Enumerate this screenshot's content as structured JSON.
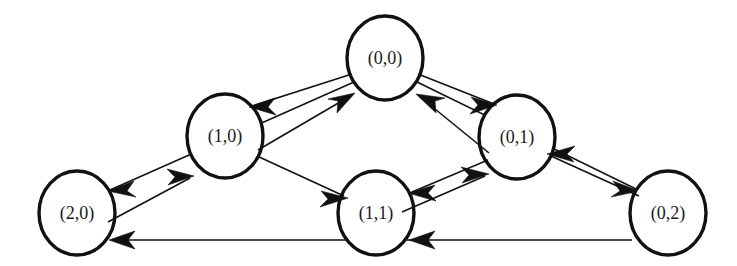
{
  "diagram": {
    "background_color": "#ffffff",
    "stroke_color": "#111111",
    "node_fill": "#ffffff",
    "width": 737,
    "height": 266,
    "node_radius": 41,
    "nodes": [
      {
        "id": "n00",
        "label": "(0,0)",
        "cx": 385,
        "cy": 58,
        "rx": 41,
        "ry": 44
      },
      {
        "id": "n10",
        "label": "(1,0)",
        "cx": 225,
        "cy": 136,
        "rx": 41,
        "ry": 44
      },
      {
        "id": "n01",
        "label": "(0,1)",
        "cx": 517,
        "cy": 137,
        "rx": 41,
        "ry": 44
      },
      {
        "id": "n20",
        "label": "(2,0)",
        "cx": 77,
        "cy": 213,
        "rx": 41,
        "ry": 44
      },
      {
        "id": "n11",
        "label": "(1,1)",
        "cx": 376,
        "cy": 213,
        "rx": 41,
        "ry": 44
      },
      {
        "id": "n02",
        "label": "(0,2)",
        "cx": 668,
        "cy": 213,
        "rx": 41,
        "ry": 44
      }
    ],
    "edges": [
      {
        "id": "e1",
        "from": "(0,0)",
        "to": "(1,0)",
        "name": "edge-00-to-10"
      },
      {
        "id": "e2",
        "from": "(0,0)",
        "to": "(2,0)",
        "name": "edge-00-to-20"
      },
      {
        "id": "e3",
        "from": "(0,0)",
        "to": "(0,1)",
        "name": "edge-00-to-01"
      },
      {
        "id": "e4",
        "from": "(0,0)",
        "to": "(0,2)",
        "name": "edge-00-to-02"
      },
      {
        "id": "e5",
        "from": "(1,0)",
        "to": "(0,0)",
        "name": "edge-10-to-00"
      },
      {
        "id": "e6",
        "from": "(1,0)",
        "to": "(1,1)",
        "name": "edge-10-to-11"
      },
      {
        "id": "e7",
        "from": "(2,0)",
        "to": "(1,0)",
        "name": "edge-20-to-10"
      },
      {
        "id": "e8",
        "from": "(1,1)",
        "to": "(0,1)",
        "name": "edge-11-to-01"
      },
      {
        "id": "e9",
        "from": "(0,1)",
        "to": "(0,0)",
        "name": "edge-01-to-00"
      },
      {
        "id": "e10",
        "from": "(0,1)",
        "to": "(1,1)",
        "name": "edge-01-to-11"
      },
      {
        "id": "e11",
        "from": "(0,2)",
        "to": "(0,1)",
        "name": "edge-02-to-01"
      },
      {
        "id": "e12",
        "from": "(0,2)",
        "to": "(1,1)",
        "name": "edge-02-to-11"
      }
    ]
  }
}
